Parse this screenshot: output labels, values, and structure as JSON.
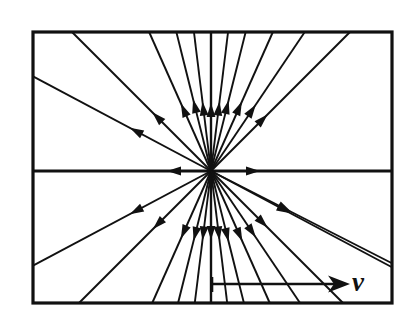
{
  "figure": {
    "type": "vector-field-diagram",
    "background_color": "#ffffff",
    "stroke_color": "#111111",
    "frame": {
      "x": 33,
      "y": 32,
      "width": 359,
      "height": 271,
      "stroke_width": 3.2
    },
    "center": {
      "x": 211,
      "y": 171
    },
    "rays": [
      {
        "name": "ray-w",
        "angle_deg": 180,
        "arrow_at": 44,
        "stroke_width": 3.0
      },
      {
        "name": "ray-e",
        "angle_deg": 0,
        "arrow_at": 49,
        "stroke_width": 3.0
      },
      {
        "name": "ray-wnw",
        "angle_deg": 208,
        "arrow_at": 92,
        "stroke_width": 1.9
      },
      {
        "name": "ray-ene",
        "angle_deg": 28,
        "arrow_at": 90,
        "stroke_width": 1.9
      },
      {
        "name": "ray-nw",
        "angle_deg": 225,
        "arrow_at": 83,
        "stroke_width": 1.9
      },
      {
        "name": "ray-ne",
        "angle_deg": 315,
        "arrow_at": 80,
        "stroke_width": 1.9
      },
      {
        "name": "ray-nnw1",
        "angle_deg": 246,
        "arrow_at": 74,
        "stroke_width": 1.9
      },
      {
        "name": "ray-nnw2",
        "angle_deg": 256,
        "arrow_at": 74,
        "stroke_width": 1.9
      },
      {
        "name": "ray-nnw3",
        "angle_deg": 263,
        "arrow_at": 70,
        "stroke_width": 1.9
      },
      {
        "name": "ray-nnw4",
        "angle_deg": 270,
        "arrow_at": 68,
        "stroke_width": 2.4
      },
      {
        "name": "ray-nne1",
        "angle_deg": 277,
        "arrow_at": 70,
        "stroke_width": 1.9
      },
      {
        "name": "ray-nne2",
        "angle_deg": 284,
        "arrow_at": 73,
        "stroke_width": 1.9
      },
      {
        "name": "ray-nne3",
        "angle_deg": 294,
        "arrow_at": 76,
        "stroke_width": 1.9
      },
      {
        "name": "ray-nne4",
        "angle_deg": 304,
        "arrow_at": 80,
        "stroke_width": 1.9
      },
      {
        "name": "ray-wsw",
        "angle_deg": 152,
        "arrow_at": 92,
        "stroke_width": 1.9
      },
      {
        "name": "ray-ese",
        "angle_deg": 27,
        "arrow_at": 90,
        "stroke_width": 1.9
      },
      {
        "name": "ray-sw",
        "angle_deg": 135,
        "arrow_at": 82,
        "stroke_width": 1.9
      },
      {
        "name": "ray-se",
        "angle_deg": 45,
        "arrow_at": 80,
        "stroke_width": 1.9
      },
      {
        "name": "ray-ssw1",
        "angle_deg": 114,
        "arrow_at": 74,
        "stroke_width": 1.9
      },
      {
        "name": "ray-ssw2",
        "angle_deg": 104,
        "arrow_at": 72,
        "stroke_width": 1.9
      },
      {
        "name": "ray-ssw3",
        "angle_deg": 97,
        "arrow_at": 70,
        "stroke_width": 1.9
      },
      {
        "name": "ray-ssw4",
        "angle_deg": 90,
        "arrow_at": 69,
        "stroke_width": 2.4
      },
      {
        "name": "ray-sse1",
        "angle_deg": 83,
        "arrow_at": 70,
        "stroke_width": 1.9
      },
      {
        "name": "ray-sse2",
        "angle_deg": 76,
        "arrow_at": 73,
        "stroke_width": 1.9
      },
      {
        "name": "ray-sse3",
        "angle_deg": 66,
        "arrow_at": 77,
        "stroke_width": 1.9
      },
      {
        "name": "ray-sse4",
        "angle_deg": 56,
        "arrow_at": 80,
        "stroke_width": 1.9
      }
    ],
    "velocity_vector": {
      "label": "v",
      "label_x": 352,
      "label_y": 269,
      "line_y": 284,
      "line_x_start": 212,
      "line_x_end": 341,
      "tick_x": 212,
      "tick_y_top": 277,
      "tick_y_bottom": 292,
      "stroke_width": 2.6
    },
    "arrow_head": {
      "length": 14,
      "half_width": 4.4
    }
  }
}
